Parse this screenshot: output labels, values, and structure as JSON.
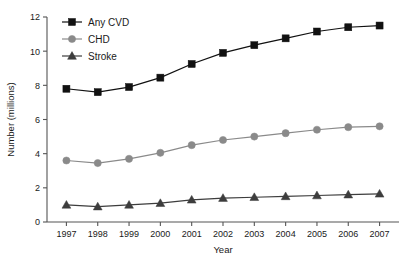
{
  "chart_data": {
    "type": "line",
    "title": "",
    "xlabel": "Year",
    "ylabel": "Number (millions)",
    "categories": [
      "1997",
      "1998",
      "1999",
      "2000",
      "2001",
      "2002",
      "2003",
      "2004",
      "2005",
      "2006",
      "2007"
    ],
    "x": [
      1997,
      1998,
      1999,
      2000,
      2001,
      2002,
      2003,
      2004,
      2005,
      2006,
      2007
    ],
    "xlim": [
      1996.5,
      2007.5
    ],
    "ylim": [
      0,
      12
    ],
    "yticks": [
      0,
      2,
      4,
      6,
      8,
      10,
      12
    ],
    "ytick_labels": [
      "0",
      "2",
      "4",
      "6",
      "8",
      "10",
      "12"
    ],
    "grid": false,
    "legend_position": "top-left-inside",
    "series": [
      {
        "name": "Any CVD",
        "marker": "square",
        "color": "#111111",
        "values": [
          7.8,
          7.6,
          7.9,
          8.45,
          9.25,
          9.9,
          10.35,
          10.75,
          11.15,
          11.4,
          11.5
        ]
      },
      {
        "name": "CHD",
        "marker": "circle",
        "color": "#8a8a8a",
        "values": [
          3.6,
          3.45,
          3.7,
          4.05,
          4.5,
          4.8,
          5.0,
          5.2,
          5.4,
          5.55,
          5.6
        ]
      },
      {
        "name": "Stroke",
        "marker": "triangle",
        "color": "#3d3d3d",
        "values": [
          1.0,
          0.9,
          1.0,
          1.1,
          1.3,
          1.4,
          1.45,
          1.5,
          1.55,
          1.6,
          1.65
        ]
      }
    ]
  },
  "axes": {
    "y_label": "Number (millions)",
    "x_label": "Year",
    "y_tick_labels": [
      "0",
      "2",
      "4",
      "6",
      "8",
      "10",
      "12"
    ],
    "x_tick_labels": [
      "1997",
      "1998",
      "1999",
      "2000",
      "2001",
      "2002",
      "2003",
      "2004",
      "2005",
      "2006",
      "2007"
    ]
  },
  "legend": {
    "items": [
      {
        "label": "Any CVD",
        "color": "#111111",
        "marker": "square"
      },
      {
        "label": "CHD",
        "color": "#8a8a8a",
        "marker": "circle"
      },
      {
        "label": "Stroke",
        "color": "#3d3d3d",
        "marker": "triangle"
      }
    ]
  },
  "colors": {
    "any_cvd": "#111111",
    "chd": "#8a8a8a",
    "stroke": "#3d3d3d",
    "axis": "#555555",
    "background": "#ffffff"
  }
}
